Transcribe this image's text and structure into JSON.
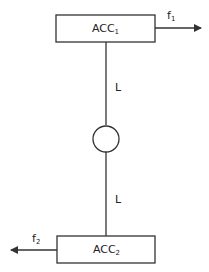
{
  "diagram": {
    "top_box": {
      "label": "ACC",
      "subscript": "1"
    },
    "bottom_box": {
      "label": "ACC",
      "subscript": "2"
    },
    "top_force": {
      "label": "f",
      "subscript": "1",
      "direction": "right"
    },
    "bottom_force": {
      "label": "f",
      "subscript": "2",
      "direction": "left"
    },
    "upper_link": {
      "label": "L"
    },
    "lower_link": {
      "label": "L"
    },
    "joint": {
      "shape": "circle"
    },
    "colors": {
      "stroke": "#333333",
      "background": "#ffffff"
    }
  }
}
